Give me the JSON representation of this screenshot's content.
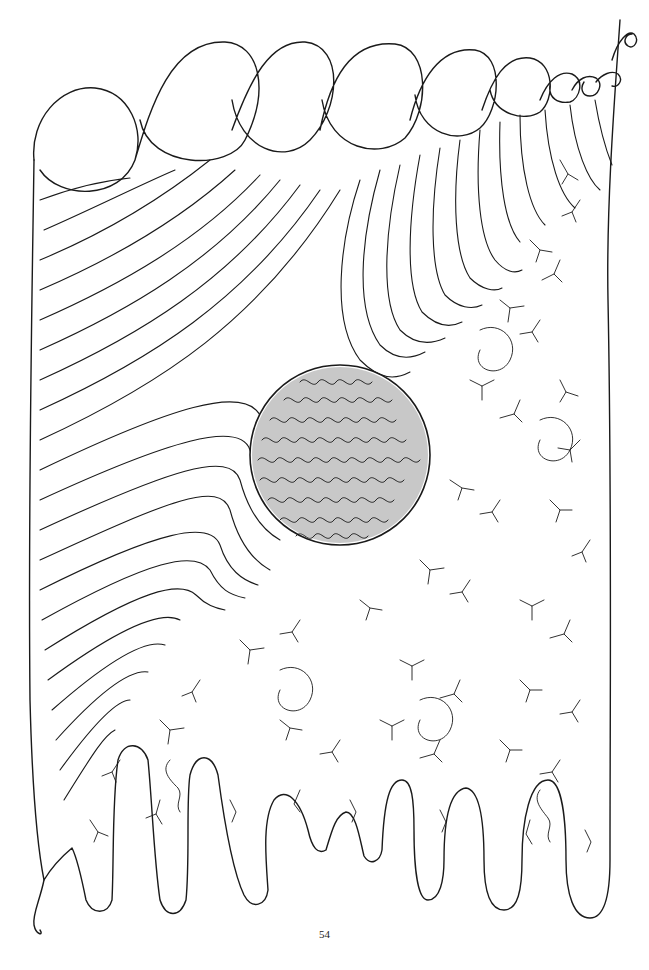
{
  "illustration": {
    "description": "Single continuous-line drawing of a cell-like form: scalloped top loops, parallel folded lines in the upper-left, a densely meandering circular nucleus at center, branching root-like texture in the lower-right, and finger-like protrusions at the bottom",
    "stroke_color": "#1a1a1a",
    "background_color": "#ffffff",
    "top_loops_count": 6,
    "bottom_fingers_count": 8
  },
  "footer": {
    "page_number": "54"
  }
}
